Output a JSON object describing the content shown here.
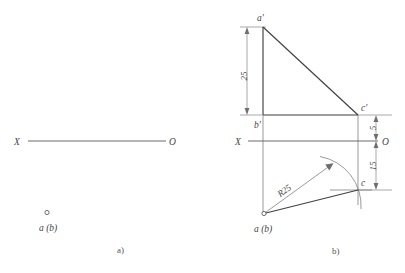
{
  "figure": {
    "title_a": "a)",
    "title_b": "b)",
    "panel_a": {
      "axis_label_left": "X",
      "axis_label_right": "O",
      "point_label": "a (b)"
    },
    "panel_b": {
      "axis_label_left": "X",
      "axis_label_right": "O",
      "labels": {
        "a_prime": "a'",
        "b_prime": "b'",
        "c_prime": "c'",
        "c": "c",
        "a_b": "a (b)"
      },
      "dimensions": {
        "vertical_25": "25",
        "right_5": "5",
        "right_15": "15",
        "radius": "R25"
      }
    },
    "colors": {
      "line": "#3f3f3f",
      "thin_line": "#6e6e6e",
      "text": "#444444",
      "background": "#ffffff"
    }
  }
}
